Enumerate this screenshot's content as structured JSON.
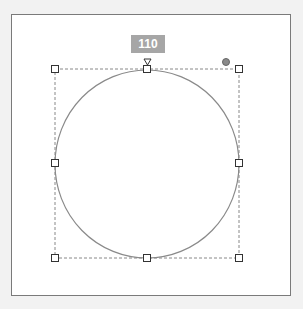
{
  "shape": {
    "type": "circle",
    "label": "110",
    "stroke_color": "#8a8a8a",
    "selection_color": "#888888",
    "handles": [
      "top-left",
      "top",
      "top-right",
      "left",
      "right",
      "bottom-left",
      "bottom",
      "bottom-right"
    ]
  },
  "colors": {
    "background": "#f2f2f2",
    "canvas": "#ffffff",
    "frame_border": "#7a7a7a",
    "badge": "#a6a6a6"
  }
}
